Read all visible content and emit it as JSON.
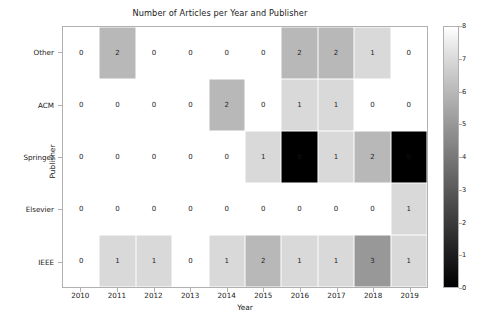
{
  "chart_data": {
    "type": "heatmap",
    "title": "Number of Articles per Year and Publisher",
    "xlabel": "Year",
    "ylabel": "Publisher",
    "categories_x": [
      "2010",
      "2011",
      "2012",
      "2013",
      "2014",
      "2015",
      "2016",
      "2017",
      "2018",
      "2019"
    ],
    "categories_y": [
      "Other",
      "ACM",
      "Springer",
      "Elsevier",
      "IEEE"
    ],
    "values": [
      [
        0,
        2,
        0,
        0,
        0,
        0,
        2,
        2,
        1,
        0
      ],
      [
        0,
        0,
        0,
        0,
        2,
        0,
        1,
        1,
        0,
        0
      ],
      [
        0,
        0,
        0,
        0,
        0,
        1,
        8,
        1,
        2,
        8
      ],
      [
        0,
        0,
        0,
        0,
        0,
        0,
        0,
        0,
        0,
        1
      ],
      [
        0,
        1,
        1,
        0,
        1,
        2,
        1,
        1,
        3,
        1
      ]
    ],
    "annot": true,
    "grid": false,
    "colorbar": {
      "label": "",
      "vmin": 0,
      "vmax": 8,
      "ticks": [
        "0",
        "1",
        "2",
        "3",
        "4",
        "5",
        "6",
        "7",
        "8"
      ],
      "colormap": "greys",
      "low_color": "#ffffff",
      "high_color": "#000000",
      "position": "right"
    },
    "cell_edge_color": "#ffffff",
    "text_color_light": "#ffffff",
    "text_color_dark": "#262626"
  }
}
